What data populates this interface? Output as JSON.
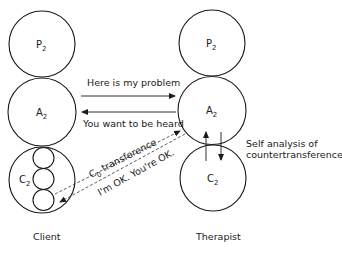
{
  "diagram": {
    "client": {
      "caption": "Client",
      "states": [
        {
          "letter": "P",
          "sub": "2"
        },
        {
          "letter": "A",
          "sub": "2"
        },
        {
          "letter": "C",
          "sub": "2"
        }
      ]
    },
    "therapist": {
      "caption": "Therapist",
      "states": [
        {
          "letter": "P",
          "sub": "2"
        },
        {
          "letter": "A",
          "sub": "2"
        },
        {
          "letter": "C",
          "sub": "2"
        }
      ]
    },
    "transactions": {
      "top_arrow_label": "Here is my problem",
      "bottom_arrow_label": "You want to be heard",
      "transference": {
        "letter": "C",
        "sub": "0",
        "rest": " transference"
      },
      "ok_label": "I'm OK. You're OK.",
      "self_analysis_line1": "Self analysis of",
      "self_analysis_line2": "countertransference"
    },
    "colors": {
      "stroke": "#1a1a1a",
      "background": "#ffffff"
    }
  }
}
